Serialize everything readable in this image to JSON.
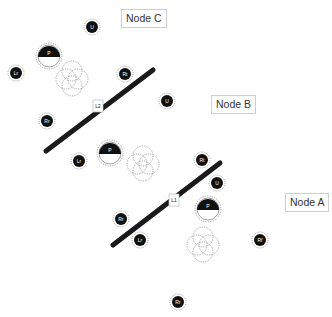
{
  "diagram": {
    "nodes": [
      {
        "id": "node-c",
        "label": "Node C",
        "x": 121,
        "y": 9
      },
      {
        "id": "node-b",
        "label": "Node B",
        "x": 211,
        "y": 95
      },
      {
        "id": "node-a",
        "label": "Node A",
        "x": 285,
        "y": 193
      }
    ],
    "links": [
      {
        "id": "link-l2",
        "label": "L2",
        "x1": 46,
        "y1": 151,
        "x2": 153,
        "y2": 70,
        "box_x": 98,
        "box_y": 106
      },
      {
        "id": "link-l1",
        "label": "L1",
        "x1": 113,
        "y1": 245,
        "x2": 220,
        "y2": 163,
        "box_x": 174,
        "box_y": 200
      }
    ],
    "antennas": [
      {
        "id": "c-u",
        "label": "U",
        "x": 92,
        "y": 27
      },
      {
        "id": "c-lr",
        "label": "Lr",
        "x": 16,
        "y": 73
      },
      {
        "id": "c-rt",
        "label": "Rt",
        "x": 125,
        "y": 74
      },
      {
        "id": "c-rr",
        "label": "Rr",
        "x": 47,
        "y": 121
      },
      {
        "id": "b-u",
        "label": "U",
        "x": 167,
        "y": 101
      },
      {
        "id": "b-lr",
        "label": "Lr",
        "x": 79,
        "y": 161
      },
      {
        "id": "a-rt",
        "label": "Rt",
        "x": 202,
        "y": 160
      },
      {
        "id": "a-u",
        "label": "U",
        "x": 217,
        "y": 183
      },
      {
        "id": "a-rr",
        "label": "Rr",
        "x": 121,
        "y": 219
      },
      {
        "id": "a-lr",
        "label": "Lr",
        "x": 140,
        "y": 240
      },
      {
        "id": "a-rf",
        "label": "Rf",
        "x": 260,
        "y": 240
      },
      {
        "id": "rr-bottom",
        "label": "Rr",
        "x": 178,
        "y": 302
      }
    ],
    "processors": [
      {
        "id": "c-p",
        "label": "P",
        "x": 49,
        "y": 56
      },
      {
        "id": "b-p",
        "label": "P",
        "x": 110,
        "y": 153
      },
      {
        "id": "a-p",
        "label": "P",
        "x": 208,
        "y": 209
      }
    ],
    "clusters": [
      {
        "id": "c-cluster",
        "x": 72,
        "y": 77
      },
      {
        "id": "b-cluster",
        "x": 143,
        "y": 162
      },
      {
        "id": "a-cluster",
        "x": 203,
        "y": 243
      }
    ],
    "colors": {
      "fill": "#111111",
      "dotted": "#9a9a9a",
      "link": "#1a1a1a",
      "label_border": "#cfcfcf"
    }
  }
}
